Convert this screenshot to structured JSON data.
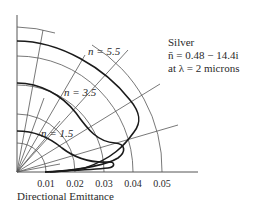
{
  "diagram": {
    "type": "polar-emittance",
    "xlabel": "Directional Emittance",
    "ticks": [
      "0.01",
      "0.02",
      "0.03",
      "0.04",
      "0.05"
    ],
    "tick_values": [
      0.01,
      0.02,
      0.03,
      0.04,
      0.05
    ],
    "ray_angles_deg": [
      10,
      20,
      30,
      40,
      50,
      60,
      70,
      80
    ],
    "annotation": {
      "line1": "Silver",
      "line2": "n̄ = 0.48 − 14.4i",
      "line3": "at λ = 2 microns"
    },
    "curves": [
      {
        "label": "n = 1.5",
        "normal_value": 0.0098,
        "peak_value": 0.032,
        "peak_angle_deg": 83
      },
      {
        "label": "n = 3.5",
        "normal_value": 0.0222,
        "peak_value": 0.036,
        "peak_angle_deg": 74
      },
      {
        "label": "n = 5.5",
        "normal_value": 0.0339,
        "peak_value": 0.04,
        "peak_angle_deg": 62
      }
    ],
    "colors": {
      "lines": "#333333",
      "curves": "#1a1a1a",
      "text": "#2a2a2a"
    }
  }
}
